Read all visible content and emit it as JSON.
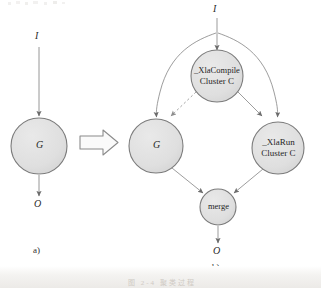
{
  "figure": {
    "kind": "graph-transformation-diagram",
    "stroke_color": "#6f6f6f",
    "node_fill": "#e2e2e2",
    "node_stroke": "#767676",
    "text_color": "#1f1f1f",
    "background": "#ffffff"
  },
  "panel_a": {
    "label": "a)",
    "input_label": "I",
    "output_label": "O",
    "node": {
      "id": "G",
      "label": "G"
    },
    "edges": [
      {
        "from": "I",
        "to": "G",
        "style": "solid"
      },
      {
        "from": "G",
        "to": "O",
        "style": "solid"
      }
    ]
  },
  "transform_arrow": {
    "name": "block-arrow",
    "direction": "right"
  },
  "panel_b": {
    "label": "b)",
    "input_label": "I",
    "output_label": "O",
    "nodes": [
      {
        "id": "xlacompile",
        "line1": "_XlaCompile",
        "line2": "Cluster C"
      },
      {
        "id": "g",
        "line1": "G",
        "line2": ""
      },
      {
        "id": "xlarun",
        "line1": "_XlaRun",
        "line2": "Cluster C"
      },
      {
        "id": "merge",
        "line1": "merge",
        "line2": ""
      }
    ],
    "edges": [
      {
        "from": "I",
        "to": "xlacompile",
        "style": "solid"
      },
      {
        "from": "I",
        "to": "g",
        "style": "solid"
      },
      {
        "from": "I",
        "to": "xlarun",
        "style": "solid"
      },
      {
        "from": "xlacompile",
        "to": "g",
        "style": "dashed"
      },
      {
        "from": "xlacompile",
        "to": "xlarun",
        "style": "solid"
      },
      {
        "from": "g",
        "to": "merge",
        "style": "solid"
      },
      {
        "from": "xlarun",
        "to": "merge",
        "style": "solid"
      },
      {
        "from": "merge",
        "to": "O",
        "style": "solid"
      }
    ]
  },
  "caption": {
    "text": "图 2-4  聚类过程"
  }
}
